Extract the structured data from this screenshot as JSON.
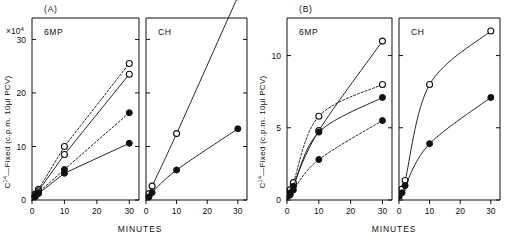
{
  "figure": {
    "group_labels": {
      "a": "(A)",
      "b": "(B)"
    },
    "axis": {
      "x_title": "MINUTES",
      "y_title_prefix": "C",
      "y_title_sup": "14",
      "y_title_rest": "—Fixed (c.p.m.  10µl  PCV)",
      "multiplier_base": "×10",
      "multiplier_exp": "4",
      "x_ticks": [
        "0",
        "10",
        "20",
        "30"
      ],
      "x_tick_values": [
        0,
        10,
        20,
        30
      ],
      "y_ticks_a": [
        "0",
        "10",
        "20",
        "30"
      ],
      "y_tick_values_a": [
        0,
        10,
        20,
        30
      ],
      "y_ticks_b": [
        "0",
        "5",
        "10"
      ],
      "y_tick_values_b": [
        0,
        5,
        10
      ],
      "xlim": [
        0,
        33
      ],
      "ylim_a": [
        0,
        34
      ],
      "ylim_b": [
        0,
        12.6
      ]
    },
    "subpanels": {
      "left": "6MP",
      "right": "CH"
    }
  },
  "chart_data": [
    {
      "id": "panel-a-6mp",
      "type": "line",
      "title": "6MP",
      "group": "(A)",
      "xlabel": "MINUTES",
      "ylabel": "C14-Fixed (c.p.m. 10µl PCV)",
      "y_multiplier": 10000,
      "xlim": [
        0,
        33
      ],
      "ylim": [
        0,
        34
      ],
      "grid": false,
      "legend": "none",
      "series": [
        {
          "name": "open-dashed-high",
          "marker": "open-circle",
          "line": "dashed",
          "x": [
            0,
            1,
            2,
            10,
            30
          ],
          "y": [
            0,
            1.1,
            2.0,
            10.0,
            25.5
          ]
        },
        {
          "name": "open-solid-high",
          "marker": "open-circle",
          "line": "solid",
          "x": [
            0,
            1,
            2,
            10,
            30
          ],
          "y": [
            0,
            0.9,
            1.7,
            8.5,
            23.5
          ]
        },
        {
          "name": "filled-dashed-mid",
          "marker": "filled-circle",
          "line": "dashed",
          "x": [
            0,
            1,
            2,
            10,
            30
          ],
          "y": [
            0,
            0.7,
            1.4,
            5.7,
            16.3
          ]
        },
        {
          "name": "filled-solid-low",
          "marker": "filled-circle",
          "line": "solid",
          "x": [
            0,
            1,
            2,
            10,
            30
          ],
          "y": [
            0,
            0.6,
            1.2,
            5.0,
            10.6
          ]
        }
      ]
    },
    {
      "id": "panel-a-ch",
      "type": "line",
      "title": "CH",
      "group": "(A)",
      "xlabel": "MINUTES",
      "ylabel": "C14-Fixed (c.p.m. 10µl PCV)",
      "y_multiplier": 10000,
      "xlim": [
        0,
        33
      ],
      "ylim": [
        0,
        34
      ],
      "grid": false,
      "legend": "none",
      "series": [
        {
          "name": "open-solid",
          "marker": "open-circle",
          "line": "solid",
          "x": [
            0,
            1,
            2,
            10,
            30
          ],
          "y": [
            0,
            1.2,
            2.6,
            12.4,
            38.0
          ]
        },
        {
          "name": "filled-solid",
          "marker": "filled-circle",
          "line": "solid",
          "x": [
            0,
            1,
            2,
            10,
            30
          ],
          "y": [
            0,
            0.6,
            1.4,
            5.6,
            13.3
          ]
        }
      ]
    },
    {
      "id": "panel-b-6mp",
      "type": "line",
      "title": "6MP",
      "group": "(B)",
      "xlabel": "MINUTES",
      "ylabel": "C14-Fixed (c.p.m. 10µl PCV)",
      "y_multiplier": 1,
      "xlim": [
        0,
        33
      ],
      "ylim": [
        0,
        12.6
      ],
      "grid": false,
      "legend": "none",
      "series": [
        {
          "name": "open-solid-high",
          "marker": "open-circle",
          "line": "solid",
          "x": [
            0,
            1,
            2,
            10,
            30
          ],
          "y": [
            0,
            0.55,
            1.05,
            4.8,
            11.0
          ]
        },
        {
          "name": "open-dashed-plateau",
          "marker": "open-circle",
          "line": "dashed",
          "x": [
            0,
            1,
            2,
            10,
            30
          ],
          "y": [
            0,
            0.7,
            1.2,
            5.8,
            8.0
          ]
        },
        {
          "name": "filled-solid-mid",
          "marker": "filled-circle",
          "line": "solid",
          "x": [
            0,
            1,
            2,
            10,
            30
          ],
          "y": [
            0,
            0.5,
            0.95,
            4.7,
            7.1
          ]
        },
        {
          "name": "filled-dashed-low",
          "marker": "filled-circle",
          "line": "dashed",
          "x": [
            0,
            1,
            2,
            10,
            30
          ],
          "y": [
            0,
            0.35,
            0.7,
            2.8,
            5.5
          ]
        }
      ]
    },
    {
      "id": "panel-b-ch",
      "type": "line",
      "title": "CH",
      "group": "(B)",
      "xlabel": "MINUTES",
      "ylabel": "C14-Fixed (c.p.m. 10µl PCV)",
      "y_multiplier": 1,
      "xlim": [
        0,
        33
      ],
      "ylim": [
        0,
        12.6
      ],
      "grid": false,
      "legend": "none",
      "series": [
        {
          "name": "open-solid",
          "marker": "open-circle",
          "line": "solid",
          "x": [
            0,
            1,
            2,
            10,
            30
          ],
          "y": [
            0,
            0.75,
            1.35,
            8.0,
            11.7
          ]
        },
        {
          "name": "filled-solid",
          "marker": "filled-circle",
          "line": "solid",
          "x": [
            0,
            1,
            2,
            10,
            30
          ],
          "y": [
            0,
            0.5,
            1.0,
            3.9,
            7.1
          ]
        }
      ]
    }
  ]
}
